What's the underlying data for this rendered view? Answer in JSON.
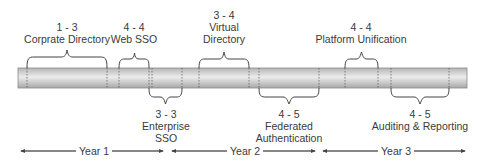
{
  "timeline": {
    "phases_above": [
      {
        "range": "1 - 3",
        "name": "Corprate Directory",
        "name2": ""
      },
      {
        "range": "4 - 4",
        "name": "Web SSO",
        "name2": ""
      },
      {
        "range": "3 - 4",
        "name": "Virtual",
        "name2": "Directory"
      },
      {
        "range": "4 - 4",
        "name": "Platform Unification",
        "name2": ""
      }
    ],
    "phases_below": [
      {
        "range": "3 - 3",
        "name": "Enterprise",
        "name2": "SSO"
      },
      {
        "range": "4 - 5",
        "name": "Federated",
        "name2": "Authentication"
      },
      {
        "range": "4 - 5",
        "name": "Auditing & Reporting",
        "name2": ""
      }
    ],
    "years": [
      {
        "label": "Year 1"
      },
      {
        "label": "Year 2"
      },
      {
        "label": "Year 3"
      }
    ]
  },
  "colors": {
    "bar_dark": "#a9a9a9",
    "bar_light": "#e6e6e6",
    "line": "#555555"
  }
}
